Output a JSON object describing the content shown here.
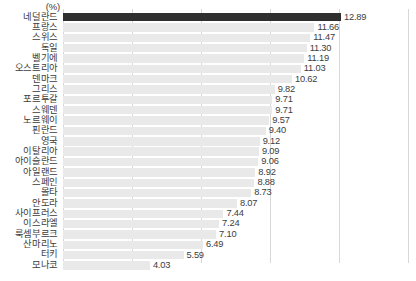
{
  "unit_label": "(%)",
  "chart_data": {
    "type": "bar",
    "orientation": "horizontal",
    "title": "",
    "xlabel": "",
    "ylabel": "",
    "unit": "(%)",
    "xlim": [
      0,
      16.0
    ],
    "gridlines": [
      0,
      3.2,
      6.4,
      9.6,
      12.8,
      16.0
    ],
    "grid": true,
    "legend": false,
    "highlight_index": 0,
    "highlight_color": "#2f2f2f",
    "bar_color": "#e9e9e9",
    "categories": [
      "네덜란드",
      "프랑스",
      "스위스",
      "독일",
      "벨기에",
      "오스트리아",
      "덴마크",
      "그리스",
      "포르투갈",
      "스웨덴",
      "노르웨이",
      "핀란드",
      "영국",
      "이탈리아",
      "아이슬란드",
      "아일랜드",
      "스페인",
      "몰타",
      "안도라",
      "사이프러스",
      "이스라엘",
      "룩셈부르크",
      "산마리노",
      "터키",
      "모나코"
    ],
    "values": [
      12.89,
      11.66,
      11.47,
      11.3,
      11.19,
      11.03,
      10.62,
      9.82,
      9.71,
      9.71,
      9.57,
      9.4,
      9.12,
      9.09,
      9.06,
      8.92,
      8.88,
      8.73,
      8.07,
      7.44,
      7.24,
      7.1,
      6.49,
      5.59,
      4.03
    ],
    "value_labels": [
      "12.89",
      "11.66",
      "11.47",
      "11.30",
      "11.19",
      "11.03",
      "10.62",
      "9.82",
      "9.71",
      "9.71",
      "9.57",
      "9.40",
      "9.12",
      "9.09",
      "9.06",
      "8.92",
      "8.88",
      "8.73",
      "8.07",
      "7.44",
      "7.24",
      "7.10",
      "6.49",
      "5.59",
      "4.03"
    ]
  }
}
